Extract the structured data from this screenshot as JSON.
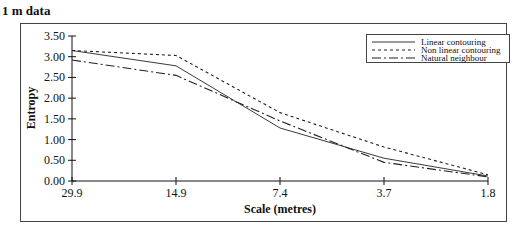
{
  "chart_data": {
    "type": "line",
    "title": "1 m data",
    "xlabel": "Scale (metres)",
    "ylabel": "Entropy",
    "categories": [
      "29.9",
      "14.9",
      "7.4",
      "3.7",
      "1.8"
    ],
    "ylim": [
      0,
      3.5
    ],
    "yticks": [
      "0.00",
      "0.50",
      "1.00",
      "1.50",
      "2.00",
      "2.50",
      "3.00",
      "3.50"
    ],
    "grid": false,
    "legend_position": "top-right",
    "series": [
      {
        "name": "Linear contouring",
        "style": "solid",
        "values": [
          3.15,
          2.78,
          1.28,
          0.55,
          0.12
        ]
      },
      {
        "name": "Non linear contouring",
        "style": "dotted",
        "values": [
          3.15,
          3.03,
          1.65,
          0.82,
          0.15
        ]
      },
      {
        "name": "Natural neighbour",
        "style": "dash-dot",
        "values": [
          2.92,
          2.55,
          1.45,
          0.45,
          0.1
        ]
      }
    ]
  }
}
